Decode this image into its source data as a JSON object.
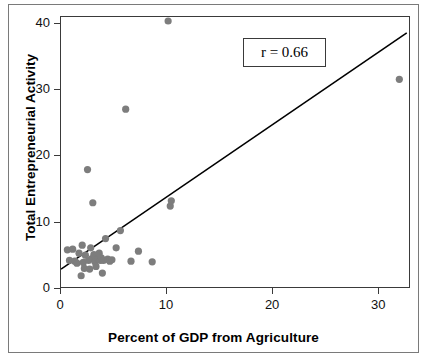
{
  "chart_data": {
    "type": "scatter",
    "title": "",
    "xlabel": "Percent of GDP from Agriculture",
    "ylabel": "Total Entrepreneurial Activity",
    "xlim": [
      0,
      33
    ],
    "ylim": [
      0,
      41
    ],
    "xticks": [
      0,
      10,
      20,
      30
    ],
    "yticks": [
      0,
      10,
      20,
      30,
      40
    ],
    "grid": false,
    "legend": null,
    "annotations": [
      {
        "name": "correlation-label",
        "text": "r = 0.66",
        "boxed": true,
        "x": 21.5,
        "y": 35.5
      }
    ],
    "series": [
      {
        "name": "countries",
        "marker": "circle",
        "color": "#7d7d7d",
        "points": [
          [
            0.6,
            5.9
          ],
          [
            0.8,
            4.3
          ],
          [
            1.1,
            6.0
          ],
          [
            1.3,
            4.2
          ],
          [
            1.5,
            3.9
          ],
          [
            1.7,
            5.4
          ],
          [
            1.9,
            2.0
          ],
          [
            2.0,
            6.6
          ],
          [
            2.1,
            4.0
          ],
          [
            2.2,
            3.1
          ],
          [
            2.3,
            5.1
          ],
          [
            2.5,
            18.0
          ],
          [
            2.6,
            4.3
          ],
          [
            2.7,
            3.0
          ],
          [
            2.8,
            6.2
          ],
          [
            2.9,
            4.6
          ],
          [
            3.0,
            13.0
          ],
          [
            3.1,
            5.2
          ],
          [
            3.2,
            4.1
          ],
          [
            3.3,
            3.4
          ],
          [
            3.5,
            4.6
          ],
          [
            3.6,
            5.4
          ],
          [
            3.7,
            4.3
          ],
          [
            3.8,
            4.7
          ],
          [
            3.9,
            2.4
          ],
          [
            4.0,
            4.3
          ],
          [
            4.2,
            7.6
          ],
          [
            4.4,
            4.5
          ],
          [
            4.6,
            4.2
          ],
          [
            4.8,
            4.4
          ],
          [
            5.2,
            6.2
          ],
          [
            5.6,
            8.8
          ],
          [
            6.1,
            27.1
          ],
          [
            6.6,
            4.2
          ],
          [
            7.3,
            5.7
          ],
          [
            8.6,
            4.1
          ],
          [
            10.1,
            40.4
          ],
          [
            10.3,
            12.5
          ],
          [
            10.4,
            13.3
          ],
          [
            31.9,
            31.6
          ]
        ]
      }
    ],
    "trendline": {
      "name": "regression-line",
      "color": "#000000",
      "x_start": 0.0,
      "y_start": 3.0,
      "x_end": 32.6,
      "y_end": 38.6
    }
  },
  "axes": {
    "x_tick_labels": [
      "0",
      "10",
      "20",
      "30"
    ],
    "y_tick_labels": [
      "0",
      "10",
      "20",
      "30",
      "40"
    ],
    "x_title": "Percent of GDP from Agriculture",
    "y_title": "Total Entrepreneurial Activity"
  },
  "annotation": {
    "correlation_text": "r = 0.66"
  },
  "colors": {
    "marker": "#7d7d7d",
    "line": "#000000",
    "frame": "#3a3a3a",
    "outer_border": "#7a7a7a",
    "background": "#ffffff"
  }
}
